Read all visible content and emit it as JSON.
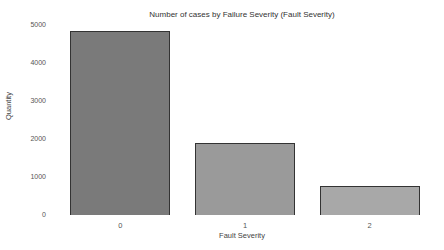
{
  "chart_data": {
    "type": "bar",
    "title": "Number of cases by Failure Severity (Fault Severity)",
    "xlabel": "Fault Severity",
    "ylabel": "Quantity",
    "categories": [
      "0",
      "1",
      "2"
    ],
    "values": [
      4830,
      1900,
      760
    ],
    "bar_colors": [
      "#7a7a7a",
      "#9a9a9a",
      "#a8a8a8"
    ],
    "edge_color": "#333333",
    "yticks": [
      0,
      1000,
      2000,
      3000,
      4000,
      5000
    ],
    "ylim": [
      0,
      5000
    ],
    "grid": false,
    "legend": null
  }
}
